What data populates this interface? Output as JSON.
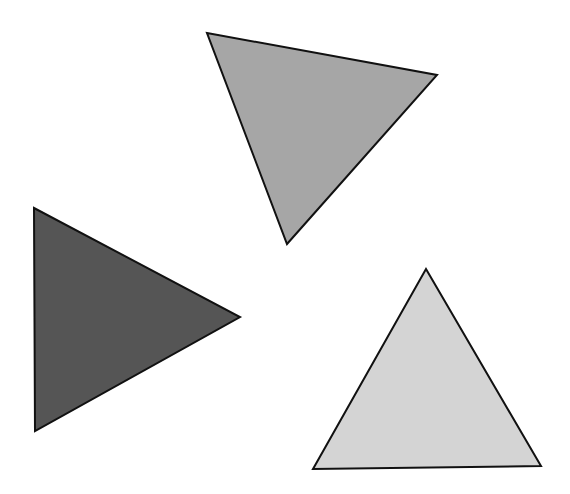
{
  "canvas": {
    "width": 570,
    "height": 494,
    "background": "#ffffff"
  },
  "shapes": [
    {
      "name": "triangle-medium-gray",
      "points": "207,33 437,75 287,244",
      "fill": "#a6a6a6",
      "stroke": "#111111"
    },
    {
      "name": "triangle-dark-gray",
      "points": "34,208 240,317 35,431",
      "fill": "#555555",
      "stroke": "#111111"
    },
    {
      "name": "triangle-light-gray",
      "points": "426,269 541,466 313,469",
      "fill": "#d4d4d4",
      "stroke": "#111111"
    }
  ]
}
